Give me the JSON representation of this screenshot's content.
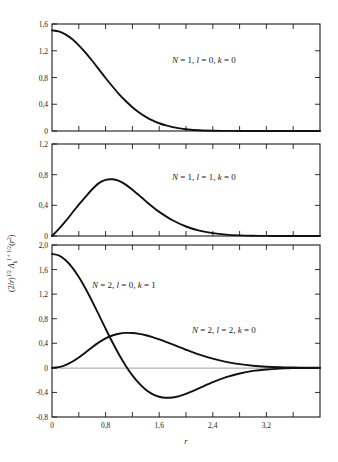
{
  "figure": {
    "xlabel": "r",
    "ylabel": "(2/r)^1/2 Λ_k^(l+1/2)(r²)",
    "ylabel_parts": {
      "prefix": "(2/r)",
      "sup1": "1/2",
      "lambda": "Λ",
      "sub": "k",
      "sup2": "l + 1/2",
      "arg": "(r²)"
    }
  },
  "chart_data": [
    {
      "type": "line",
      "panel": 1,
      "title": "",
      "annotation": "N = 1, l = 0, k = 0",
      "annotation_tokens": [
        "N",
        " = 1, ",
        "l",
        " = 0, ",
        "k",
        " = 0"
      ],
      "xlabel": "",
      "ylabel": "",
      "xlim": [
        0,
        4.0
      ],
      "ylim": [
        0,
        1.6
      ],
      "yticks": [
        0,
        0.4,
        0.8,
        1.2,
        1.6
      ],
      "ytick_labels": [
        "0",
        "0,4",
        "0,8",
        "1,2",
        "1,6"
      ],
      "xticks": [
        0,
        0.8,
        1.6,
        2.4,
        3.2
      ],
      "xtick_labels": [
        "",
        "",
        "",
        "",
        ""
      ],
      "minor_xticks": [
        0.4,
        1.2,
        2.0,
        2.8,
        3.6
      ],
      "grid": false,
      "legend": "none",
      "series": [
        {
          "name": "N = 1, l = 0, k = 0",
          "x": [
            0.0,
            0.1,
            0.2,
            0.3,
            0.4,
            0.5,
            0.6,
            0.7,
            0.8,
            0.9,
            1.0,
            1.1,
            1.2,
            1.3,
            1.4,
            1.5,
            1.6,
            1.7,
            1.8,
            1.9,
            2.0,
            2.2,
            2.4,
            2.6,
            2.8,
            3.0,
            3.2,
            3.4,
            3.6,
            3.8,
            4.0
          ],
          "y": [
            1.504,
            1.489,
            1.445,
            1.374,
            1.281,
            1.172,
            1.05,
            0.922,
            0.793,
            0.669,
            0.553,
            0.448,
            0.356,
            0.277,
            0.212,
            0.158,
            0.116,
            0.083,
            0.058,
            0.04,
            0.027,
            0.011,
            0.004,
            0.002,
            0.001,
            0.0,
            0.0,
            0.0,
            0.0,
            0.0,
            0.0
          ]
        }
      ]
    },
    {
      "type": "line",
      "panel": 2,
      "title": "",
      "annotation": "N = 1, l = 1, k = 0",
      "annotation_tokens": [
        "N",
        " = 1, ",
        "l",
        " = 1, ",
        "k",
        " = 0"
      ],
      "xlabel": "",
      "ylabel": "",
      "xlim": [
        0,
        4.0
      ],
      "ylim": [
        0,
        1.2
      ],
      "yticks": [
        0,
        0.4,
        0.8,
        1.2
      ],
      "ytick_labels": [
        "0",
        "0,4",
        "0,8",
        "1,2"
      ],
      "xticks": [
        0,
        0.8,
        1.6,
        2.4,
        3.2
      ],
      "xtick_labels": [
        "",
        "",
        "",
        "",
        ""
      ],
      "minor_xticks": [
        0.4,
        1.2,
        2.0,
        2.8,
        3.6
      ],
      "grid": false,
      "legend": "none",
      "series": [
        {
          "name": "N = 1, l = 1, k = 0",
          "x": [
            0.0,
            0.1,
            0.2,
            0.3,
            0.4,
            0.5,
            0.6,
            0.7,
            0.8,
            0.9,
            1.0,
            1.1,
            1.2,
            1.3,
            1.4,
            1.5,
            1.6,
            1.8,
            2.0,
            2.2,
            2.4,
            2.6,
            2.8,
            3.0,
            3.2,
            3.4,
            3.6,
            3.8,
            4.0
          ],
          "y": [
            0.0,
            0.09,
            0.19,
            0.3,
            0.41,
            0.51,
            0.61,
            0.69,
            0.733,
            0.74,
            0.718,
            0.67,
            0.604,
            0.53,
            0.455,
            0.382,
            0.315,
            0.205,
            0.124,
            0.07,
            0.037,
            0.018,
            0.008,
            0.003,
            0.001,
            0.0,
            0.0,
            0.0,
            0.0
          ]
        }
      ]
    },
    {
      "type": "line",
      "panel": 3,
      "title": "",
      "annotations": [
        "N = 2, l = 0, k = 1",
        "N = 2, l = 2, k = 0"
      ],
      "annotation_tokens_1": [
        "N",
        " = 2, ",
        "l",
        " = 0, ",
        "k",
        " = 1"
      ],
      "annotation_tokens_2": [
        "N",
        " = 2, ",
        "l",
        " = 2, ",
        "k",
        " = 0"
      ],
      "xlabel": "r",
      "ylabel": "",
      "xlim": [
        0,
        4.0
      ],
      "ylim": [
        -0.8,
        2.0
      ],
      "yticks": [
        -0.8,
        -0.4,
        0,
        0.4,
        0.8,
        1.2,
        1.6,
        2.0
      ],
      "ytick_labels": [
        "-0,8",
        "-0,4",
        "0",
        "0,4",
        "0,8",
        "1,2",
        "1,6",
        "2,0"
      ],
      "xticks": [
        0,
        0.8,
        1.6,
        2.4,
        3.2
      ],
      "xtick_labels": [
        "0",
        "0,8",
        "1,6",
        "2,4",
        "3,2"
      ],
      "minor_xticks": [
        0.4,
        1.2,
        2.0,
        2.8,
        3.6
      ],
      "grid": false,
      "zero_line": true,
      "legend": "none",
      "series": [
        {
          "name": "N = 2, l = 0, k = 1",
          "x": [
            0.0,
            0.1,
            0.2,
            0.3,
            0.4,
            0.5,
            0.6,
            0.7,
            0.8,
            0.9,
            1.0,
            1.1,
            1.2,
            1.3,
            1.4,
            1.5,
            1.6,
            1.7,
            1.8,
            1.9,
            2.0,
            2.1,
            2.2,
            2.4,
            2.6,
            2.8,
            3.0,
            3.2,
            3.4,
            3.6,
            3.8,
            4.0
          ],
          "y": [
            1.855,
            1.83,
            1.755,
            1.636,
            1.48,
            1.292,
            1.083,
            0.862,
            0.638,
            0.42,
            0.217,
            0.035,
            -0.123,
            -0.254,
            -0.355,
            -0.427,
            -0.47,
            -0.487,
            -0.482,
            -0.459,
            -0.423,
            -0.379,
            -0.331,
            -0.234,
            -0.152,
            -0.091,
            -0.05,
            -0.026,
            -0.012,
            -0.005,
            -0.002,
            -0.001
          ]
        },
        {
          "name": "N = 2, l = 2, k = 0",
          "x": [
            0.0,
            0.1,
            0.2,
            0.3,
            0.4,
            0.5,
            0.6,
            0.7,
            0.8,
            0.9,
            1.0,
            1.1,
            1.2,
            1.3,
            1.4,
            1.5,
            1.6,
            1.7,
            1.8,
            2.0,
            2.2,
            2.4,
            2.6,
            2.8,
            3.0,
            3.2,
            3.4,
            3.6,
            3.8,
            4.0
          ],
          "y": [
            0.0,
            0.012,
            0.046,
            0.1,
            0.17,
            0.252,
            0.337,
            0.415,
            0.48,
            0.527,
            0.556,
            0.569,
            0.568,
            0.554,
            0.531,
            0.5,
            0.463,
            0.423,
            0.381,
            0.295,
            0.215,
            0.149,
            0.097,
            0.06,
            0.035,
            0.019,
            0.01,
            0.005,
            0.002,
            0.001
          ]
        }
      ]
    }
  ]
}
